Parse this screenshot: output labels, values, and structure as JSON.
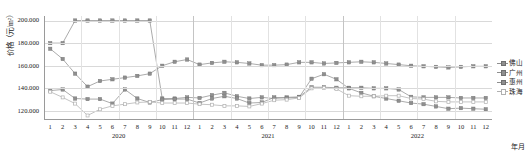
{
  "chart_data": {
    "type": "line",
    "title": "",
    "xlabel": "年月",
    "ylabel": "价格（元/m²）",
    "ylim": [
      112000,
      204000
    ],
    "yticks": [
      120000,
      140000,
      160000,
      180000,
      200000
    ],
    "ytick_labels": [
      "120.000",
      "140.000",
      "160.000",
      "180.000",
      "200.000"
    ],
    "grid": true,
    "legend_position": "right",
    "x": [
      "2020-1",
      "2020-2",
      "2020-3",
      "2020-4",
      "2020-5",
      "2020-6",
      "2020-7",
      "2020-8",
      "2020-9",
      "2020-10",
      "2020-11",
      "2020-12",
      "2021-1",
      "2021-2",
      "2021-3",
      "2021-4",
      "2021-5",
      "2021-6",
      "2021-7",
      "2021-8",
      "2021-9",
      "2021-10",
      "2021-11",
      "2021-12",
      "2022-1",
      "2022-2",
      "2022-3",
      "2022-4",
      "2022-5",
      "2022-6",
      "2022-7",
      "2022-8",
      "2022-9",
      "2022-10",
      "2022-11",
      "2022-12"
    ],
    "month_labels": [
      "1",
      "2",
      "3",
      "4",
      "5",
      "6",
      "7",
      "8",
      "9",
      "10",
      "11",
      "12",
      "1",
      "2",
      "3",
      "4",
      "5",
      "6",
      "7",
      "8",
      "9",
      "10",
      "11",
      "12",
      "1",
      "2",
      "3",
      "4",
      "5",
      "6",
      "7",
      "8",
      "9",
      "10",
      "11",
      "12"
    ],
    "year_groups": [
      {
        "label": "2020",
        "start_index": 0,
        "end_index": 11
      },
      {
        "label": "2021",
        "start_index": 12,
        "end_index": 23
      },
      {
        "label": "2022",
        "start_index": 24,
        "end_index": 35
      }
    ],
    "series": [
      {
        "name": "佛山",
        "color": "#8f8f8f",
        "marker": "square",
        "values": [
          180000,
          180000,
          200000,
          200000,
          200000,
          200000,
          200000,
          200000,
          200000,
          131000,
          131000,
          132000,
          131500,
          134000,
          136000,
          133000,
          131000,
          132000,
          131000,
          132000,
          132500,
          141000,
          141000,
          140500,
          140500,
          140500,
          140000,
          140000,
          139000,
          132500,
          132000,
          132000,
          132000,
          131500,
          131500,
          131500
        ]
      },
      {
        "name": "广州",
        "color": "#8f8f8f",
        "marker": "square",
        "values": [
          175000,
          166000,
          153000,
          141500,
          146500,
          148000,
          149500,
          151000,
          153000,
          160000,
          163500,
          165500,
          161000,
          162500,
          163500,
          163000,
          162000,
          160500,
          160500,
          161000,
          163000,
          163000,
          162000,
          162500,
          163000,
          163500,
          163000,
          162000,
          161000,
          160000,
          159500,
          159000,
          158500,
          159000,
          159500,
          159500
        ]
      },
      {
        "name": "惠州",
        "color": "#8f8f8f",
        "marker": "square",
        "values": [
          138000,
          139000,
          131000,
          130500,
          130500,
          126500,
          139000,
          131000,
          127500,
          130000,
          130500,
          130500,
          127000,
          131000,
          133000,
          131000,
          127000,
          127500,
          132000,
          131500,
          132000,
          148500,
          152500,
          148000,
          140000,
          136000,
          133000,
          131000,
          129000,
          127000,
          126000,
          124000,
          122000,
          122500,
          122000,
          121500
        ]
      },
      {
        "name": "珠海",
        "color": "#b0b0b0",
        "marker": "hollow",
        "values": [
          137000,
          132000,
          126500,
          116000,
          121500,
          124500,
          126000,
          127500,
          128000,
          127000,
          127000,
          127000,
          126000,
          125500,
          124500,
          124500,
          124000,
          126500,
          129500,
          130000,
          131500,
          140000,
          140500,
          139500,
          133500,
          133000,
          133000,
          133500,
          133500,
          131000,
          130500,
          128500,
          128000,
          128000,
          128000,
          128000
        ]
      }
    ]
  },
  "legend": {
    "items": [
      {
        "label": "佛山"
      },
      {
        "label": "广州"
      },
      {
        "label": "惠州"
      },
      {
        "label": "珠海"
      }
    ]
  },
  "axes": {
    "y_title": "价格（元/m²）",
    "x_title": "年月"
  }
}
